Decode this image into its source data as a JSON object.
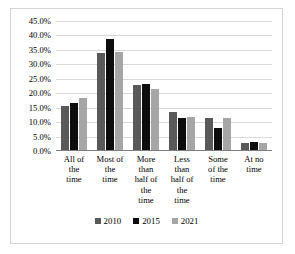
{
  "chart_data": {
    "type": "bar",
    "title": "",
    "xlabel": "",
    "ylabel": "",
    "ylim": [
      0,
      45
    ],
    "grid": true,
    "legend_position": "bottom",
    "categories": [
      "All of the time",
      "Most of the time",
      "More than half of the time",
      "Less than half of the time",
      "Some of the time",
      "At no time"
    ],
    "category_lines": [
      [
        "All of",
        "the",
        "time"
      ],
      [
        "Most of",
        "the",
        "time"
      ],
      [
        "More",
        "than",
        "half of",
        "the",
        "time"
      ],
      [
        "Less",
        "than",
        "half of",
        "the",
        "time"
      ],
      [
        "Some",
        "of the",
        "time"
      ],
      [
        "At no",
        "time"
      ]
    ],
    "ytick_labels": [
      "45.0%",
      "40.0%",
      "35.0%",
      "30.0%",
      "25.0%",
      "20.0%",
      "15.0%",
      "10.0%",
      "5.0%",
      "0.0%"
    ],
    "ytick_values": [
      45,
      40,
      35,
      30,
      25,
      20,
      15,
      10,
      5,
      0
    ],
    "series": [
      {
        "name": "2010",
        "color": "#595959",
        "values": [
          15.5,
          34.0,
          23.0,
          13.4,
          11.4,
          2.8
        ]
      },
      {
        "name": "2015",
        "color": "#0d0d0d",
        "values": [
          16.7,
          38.7,
          23.2,
          11.3,
          7.9,
          3.0
        ]
      },
      {
        "name": "2021",
        "color": "#a6a6a6",
        "values": [
          18.3,
          34.3,
          21.3,
          11.8,
          11.5,
          2.9
        ]
      }
    ]
  },
  "legend": {
    "items": [
      {
        "label": "2010"
      },
      {
        "label": "2015"
      },
      {
        "label": "2021"
      }
    ]
  }
}
